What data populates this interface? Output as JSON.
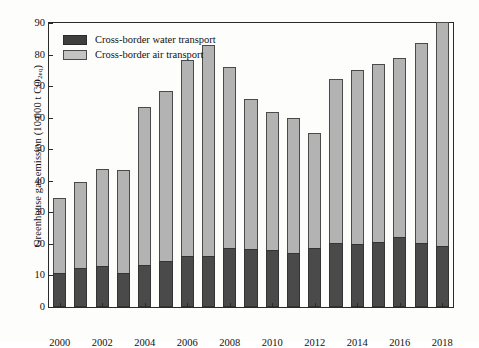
{
  "chart_data": {
    "type": "bar",
    "stacked": true,
    "title": "",
    "xlabel": "",
    "ylabel": "Greenhouse gas emission (10 000 t CO2eq)",
    "ylabel_main": "Greenhouse gas emission (10 000 t CO",
    "ylabel_sub": "2eq",
    "ylabel_tail": ")",
    "ylim": [
      0,
      90
    ],
    "yticks": [
      0,
      10,
      20,
      30,
      40,
      50,
      60,
      70,
      80,
      90
    ],
    "ytick_labels": [
      "0",
      "10",
      "20",
      "30",
      "40",
      "50",
      "60",
      "70",
      "80",
      "90"
    ],
    "grid": false,
    "legend_position": "top-left",
    "categories": [
      "2000",
      "2001",
      "2002",
      "2003",
      "2004",
      "2005",
      "2006",
      "2007",
      "2008",
      "2009",
      "2010",
      "2011",
      "2012",
      "2013",
      "2014",
      "2015",
      "2016",
      "2017",
      "2018"
    ],
    "xtick_labels": [
      "2000",
      "2002",
      "2004",
      "2006",
      "2008",
      "2010",
      "2012",
      "2014",
      "2016",
      "2018"
    ],
    "series": [
      {
        "name": "Cross-border water transport",
        "color": "#4a4a4a",
        "values": [
          10.9,
          12.4,
          13.0,
          10.9,
          13.2,
          14.6,
          16.1,
          16.3,
          18.7,
          18.3,
          18.2,
          17.2,
          18.6,
          20.3,
          20.1,
          20.6,
          22.1,
          20.3,
          19.4
        ]
      },
      {
        "name": "Cross-border air transport",
        "color": "#b3b3b3",
        "values": [
          23.8,
          27.3,
          30.7,
          32.5,
          50.1,
          53.9,
          62.1,
          66.8,
          57.5,
          47.7,
          43.6,
          42.6,
          36.4,
          51.9,
          55.0,
          56.4,
          56.8,
          63.4,
          70.8
        ]
      }
    ],
    "totals": [
      34.7,
      39.7,
      43.7,
      43.4,
      63.3,
      68.5,
      78.2,
      83.1,
      76.2,
      66.0,
      61.8,
      59.8,
      55.0,
      72.2,
      75.1,
      77.0,
      78.9,
      83.7,
      90.2
    ]
  },
  "legend": {
    "items": [
      {
        "label": "Cross-border water transport",
        "swatch": "water"
      },
      {
        "label": "Cross-border air transport",
        "swatch": "air"
      }
    ]
  }
}
